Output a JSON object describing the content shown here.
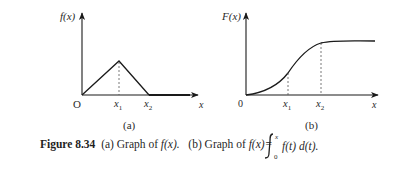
{
  "panels": [
    {
      "id": "a",
      "panel_label": "(a)",
      "y_axis_label": "f(x)",
      "x_axis_label": "x",
      "origin_label": "O",
      "tick_labels": [
        "x1",
        "x2"
      ],
      "description": "Triangular function rising linearly from 0 at origin to a peak at x1, falling linearly to 0 at x2, zero thereafter"
    },
    {
      "id": "b",
      "panel_label": "(b)",
      "y_axis_label": "F(x)",
      "x_axis_label": "x",
      "origin_label": "0",
      "tick_labels": [
        "x1",
        "x2"
      ],
      "description": "S-shaped cumulative curve starting at 0, inflection at x1, levelling to a constant plateau at x2"
    }
  ],
  "caption": {
    "figure_number": "Figure 8.34",
    "part_a": "(a) Graph of",
    "part_a_fx": "f(x).",
    "part_b": "(b) Graph of",
    "part_b_fx": "f(x)=",
    "integral_lower": "0",
    "integral_upper": "x",
    "integrand": "f(t) d(t)."
  },
  "colors": {
    "ink": "#1a1a1a",
    "dashed": "#555555",
    "background": "#ffffff"
  }
}
